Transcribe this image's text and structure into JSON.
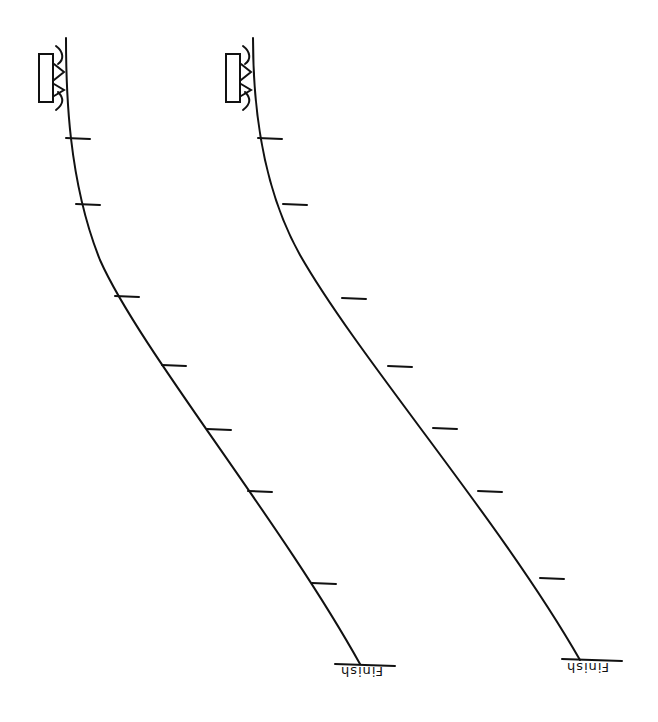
{
  "diagram": {
    "tracks": [
      {
        "id": "left",
        "start_object": "block-on-track",
        "finish_label": "Finish",
        "path": "M66,38 C66,90 68,180 100,260 C140,350 280,520 360,664",
        "ticks": [
          [
            66,
            138
          ],
          [
            76,
            204
          ],
          [
            115,
            296
          ],
          [
            162,
            365
          ],
          [
            207,
            429
          ],
          [
            248,
            491
          ],
          [
            312,
            583
          ]
        ],
        "finish_line": [
          335,
          664,
          395,
          666
        ],
        "label_pos": [
          340,
          668
        ]
      },
      {
        "id": "right",
        "start_object": "block-on-track",
        "finish_label": "Finish",
        "path": "M253,38 C253,90 258,180 300,255 C360,360 500,520 580,660",
        "ticks": [
          [
            258,
            138
          ],
          [
            283,
            204
          ],
          [
            342,
            298
          ],
          [
            388,
            366
          ],
          [
            433,
            428
          ],
          [
            478,
            491
          ],
          [
            540,
            578
          ]
        ],
        "finish_line": [
          562,
          659,
          622,
          661
        ],
        "label_pos": [
          565,
          664
        ]
      }
    ]
  }
}
